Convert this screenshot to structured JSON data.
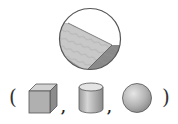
{
  "figure": {
    "magnifier": {
      "subject": "wooden-block-corner",
      "border_color": "#555555",
      "top_face_color": "#c8c8c8",
      "side_face_color": "#8a8a8a"
    },
    "choices": {
      "open_paren": "(",
      "close_paren": ")",
      "separator": ",",
      "options": [
        {
          "name": "cube",
          "color": "#b0b0b0"
        },
        {
          "name": "cylinder",
          "color": "#c4c4c4"
        },
        {
          "name": "sphere",
          "color": "#b8b8b8"
        }
      ]
    }
  }
}
